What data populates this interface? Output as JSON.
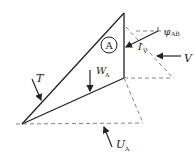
{
  "diagram": {
    "block_label": "A",
    "forces": {
      "T": {
        "label": "T",
        "sub": ""
      },
      "W": {
        "label": "W",
        "sub": "A"
      },
      "V": {
        "label": "V",
        "sub": ""
      },
      "U": {
        "label": "U",
        "sub": "A"
      },
      "I": {
        "label": "I",
        "sub": "V"
      }
    },
    "angle": {
      "symbol": "φ",
      "sub": "AB"
    },
    "colors": {
      "line": "#222222",
      "dashed": "#777777"
    }
  }
}
